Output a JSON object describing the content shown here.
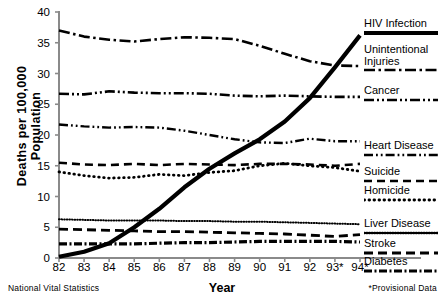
{
  "chart_data": {
    "type": "line",
    "title": "",
    "xlabel": "Year",
    "ylabel": "Deaths per 100,000 Population",
    "ylim": [
      0,
      40
    ],
    "yticks": [
      0,
      5,
      10,
      15,
      20,
      25,
      30,
      35,
      40
    ],
    "grid": false,
    "legend_position": "right",
    "x": [
      "82",
      "83",
      "84",
      "85",
      "86",
      "87",
      "88",
      "89",
      "90",
      "91",
      "92",
      "93*",
      "94*"
    ],
    "categories": [
      "82",
      "83",
      "84",
      "85",
      "86",
      "87",
      "88",
      "89",
      "90",
      "91",
      "92",
      "93*",
      "94*"
    ],
    "source_note": "National Vital Statistics",
    "footnote": "*Provisional Data",
    "series": [
      {
        "name": "HIV Infection",
        "style": "solid-thick",
        "values": [
          0.2,
          1.0,
          2.4,
          5.0,
          8.0,
          11.5,
          14.5,
          17.0,
          19.3,
          22.2,
          26.0,
          31.0,
          36.2
        ]
      },
      {
        "name": "Unintentional Injuries",
        "style": "dash-dot",
        "values": [
          37.0,
          36.0,
          35.5,
          35.2,
          35.6,
          35.9,
          35.8,
          35.6,
          34.5,
          33.2,
          32.0,
          31.3,
          31.2
        ]
      },
      {
        "name": "Cancer",
        "style": "dash-dot-dot",
        "values": [
          26.7,
          26.6,
          27.1,
          26.9,
          26.8,
          26.8,
          26.7,
          26.4,
          26.3,
          26.4,
          26.3,
          26.2,
          26.2
        ]
      },
      {
        "name": "Heart Disease",
        "style": "dash-dot-dot-fine",
        "values": [
          21.7,
          21.4,
          21.2,
          21.3,
          21.2,
          20.7,
          20.0,
          19.3,
          18.8,
          18.7,
          19.4,
          19.0,
          19.0
        ]
      },
      {
        "name": "Suicide",
        "style": "dashed",
        "values": [
          15.5,
          15.2,
          15.1,
          15.3,
          15.1,
          15.3,
          15.2,
          15.1,
          15.3,
          15.3,
          15.2,
          15.0,
          15.3
        ]
      },
      {
        "name": "Homicide",
        "style": "dotted",
        "values": [
          14.0,
          13.4,
          13.0,
          13.1,
          13.6,
          13.4,
          13.9,
          14.2,
          15.0,
          15.4,
          15.0,
          14.7,
          14.1
        ]
      },
      {
        "name": "Liver Disease",
        "style": "fine-dotted",
        "values": [
          6.3,
          6.2,
          6.1,
          6.1,
          6.1,
          6.0,
          6.0,
          5.9,
          5.9,
          5.8,
          5.7,
          5.6,
          5.5
        ]
      },
      {
        "name": "Stroke",
        "style": "long-dash",
        "values": [
          4.7,
          4.6,
          4.5,
          4.4,
          4.3,
          4.3,
          4.2,
          4.1,
          4.0,
          3.9,
          3.7,
          3.5,
          3.8
        ]
      },
      {
        "name": "Diabetes",
        "style": "dash-dot-thick",
        "values": [
          2.3,
          2.3,
          2.3,
          2.3,
          2.4,
          2.5,
          2.5,
          2.6,
          2.7,
          2.7,
          2.7,
          2.7,
          2.6
        ]
      }
    ]
  },
  "axis": {
    "y_title": "Deaths per 100,000 Population",
    "x_title": "Year",
    "y_ticks": [
      "40",
      "35",
      "30",
      "25",
      "20",
      "15",
      "10",
      "5",
      "0"
    ],
    "x_ticks": [
      "82",
      "83",
      "84",
      "85",
      "86",
      "87",
      "88",
      "89",
      "90",
      "91",
      "92",
      "93*",
      "94*"
    ]
  },
  "notes": {
    "source": "National Vital Statistics",
    "provisional": "*Provisional Data"
  },
  "legend": {
    "items": [
      {
        "label": "HIV Infection",
        "label2": ""
      },
      {
        "label": "Unintentional",
        "label2": "Injuries"
      },
      {
        "label": "Cancer",
        "label2": ""
      },
      {
        "label": "Heart Disease",
        "label2": ""
      },
      {
        "label": "Suicide",
        "label2": ""
      },
      {
        "label": "Homicide",
        "label2": ""
      },
      {
        "label": "Liver Disease",
        "label2": ""
      },
      {
        "label": "Stroke",
        "label2": ""
      },
      {
        "label": "Diabetes",
        "label2": ""
      }
    ]
  },
  "colors": {
    "ink": "#000000",
    "axis": "#808080",
    "background": "#ffffff"
  }
}
